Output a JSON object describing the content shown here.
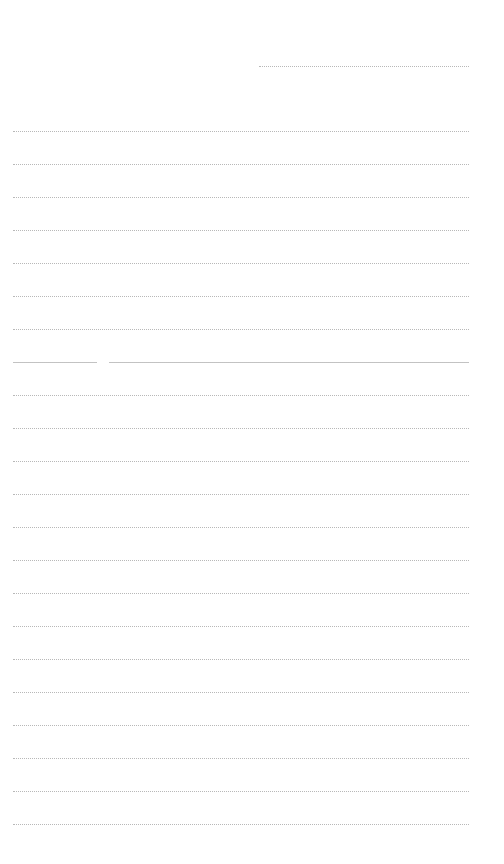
{
  "page": {
    "type": "lined-paper",
    "background": "#ffffff",
    "rule_color": "#b8b8b8",
    "header_line": {
      "x": 259,
      "y": 66,
      "width": 210
    },
    "rules": {
      "x": 13,
      "width": 456,
      "start_y": 131,
      "spacing": 33,
      "count": 22
    }
  }
}
